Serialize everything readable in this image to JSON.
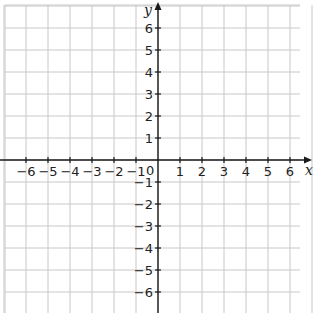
{
  "chart_data": {
    "type": "coordinate-grid",
    "xlabel": "x",
    "ylabel": "y",
    "x_range": [
      -6,
      6
    ],
    "y_range": [
      -6,
      6
    ],
    "x_ticks": [
      -6,
      -5,
      -4,
      -3,
      -2,
      -1,
      1,
      2,
      3,
      4,
      5,
      6
    ],
    "y_ticks": [
      6,
      5,
      4,
      3,
      2,
      1,
      -1,
      -2,
      -3,
      -4,
      -5,
      -6
    ],
    "origin_label": "0",
    "grid": true
  },
  "labels": {
    "x_axis": "x",
    "y_axis": "y",
    "origin": "0",
    "x_ticks": [
      "−6",
      "−5",
      "−4",
      "−3",
      "−2",
      "−1",
      "1",
      "2",
      "3",
      "4",
      "5",
      "6"
    ],
    "y_ticks": [
      "6",
      "5",
      "4",
      "3",
      "2",
      "1",
      "−1",
      "−2",
      "−3",
      "−4",
      "−5",
      "−6"
    ]
  },
  "colors": {
    "grid": "#c8c8c8",
    "axis": "#1a1a1a"
  }
}
